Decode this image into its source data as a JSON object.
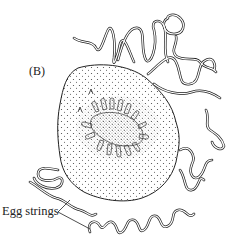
{
  "figure": {
    "panel_label": "(B)",
    "callout_label": "Egg strings",
    "stroke_color": "#222222",
    "stipple_color": "#444444",
    "background": "#ffffff"
  }
}
